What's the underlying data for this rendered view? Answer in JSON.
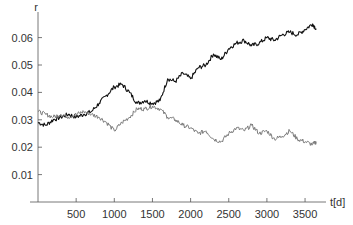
{
  "chart_data": {
    "type": "line",
    "title": "",
    "xlabel": "t[d]",
    "ylabel": "r",
    "xlim": [
      0,
      3700
    ],
    "ylim": [
      0,
      0.067
    ],
    "x_ticks": [
      500,
      1000,
      1500,
      2000,
      2500,
      3000,
      3500
    ],
    "y_ticks": [
      0.01,
      0.02,
      0.03,
      0.04,
      0.05,
      0.06
    ],
    "x_tick_labels": [
      "500",
      "1000",
      "1500",
      "2000",
      "2500",
      "3000",
      "3500"
    ],
    "y_tick_labels": [
      "0.01",
      "0.02",
      "0.03",
      "0.04",
      "0.05",
      "0.06"
    ],
    "grid": false,
    "legend": null,
    "series": [
      {
        "name": "black series (rising)",
        "color": "#111111",
        "x": [
          0,
          100,
          200,
          300,
          400,
          500,
          600,
          700,
          800,
          900,
          1000,
          1100,
          1200,
          1300,
          1400,
          1500,
          1600,
          1700,
          1800,
          1900,
          2000,
          2100,
          2200,
          2300,
          2400,
          2500,
          2600,
          2700,
          2800,
          2900,
          3000,
          3100,
          3200,
          3300,
          3400,
          3500,
          3600,
          3650
        ],
        "values": [
          0.029,
          0.028,
          0.03,
          0.031,
          0.032,
          0.031,
          0.032,
          0.033,
          0.036,
          0.039,
          0.042,
          0.043,
          0.04,
          0.036,
          0.037,
          0.036,
          0.037,
          0.045,
          0.044,
          0.047,
          0.045,
          0.049,
          0.05,
          0.054,
          0.052,
          0.056,
          0.058,
          0.059,
          0.057,
          0.058,
          0.06,
          0.059,
          0.061,
          0.062,
          0.061,
          0.063,
          0.065,
          0.063
        ]
      },
      {
        "name": "gray series (falling)",
        "color": "#7a7a7a",
        "x": [
          0,
          100,
          200,
          300,
          400,
          500,
          600,
          700,
          800,
          900,
          1000,
          1100,
          1200,
          1300,
          1400,
          1500,
          1600,
          1700,
          1800,
          1900,
          2000,
          2100,
          2200,
          2300,
          2400,
          2500,
          2600,
          2700,
          2800,
          2900,
          3000,
          3100,
          3200,
          3300,
          3400,
          3500,
          3600,
          3650
        ],
        "values": [
          0.033,
          0.032,
          0.031,
          0.032,
          0.031,
          0.032,
          0.033,
          0.032,
          0.031,
          0.029,
          0.026,
          0.029,
          0.031,
          0.034,
          0.034,
          0.035,
          0.034,
          0.031,
          0.03,
          0.028,
          0.027,
          0.025,
          0.026,
          0.023,
          0.022,
          0.025,
          0.027,
          0.026,
          0.028,
          0.025,
          0.026,
          0.023,
          0.024,
          0.026,
          0.023,
          0.022,
          0.021,
          0.022
        ]
      }
    ]
  }
}
